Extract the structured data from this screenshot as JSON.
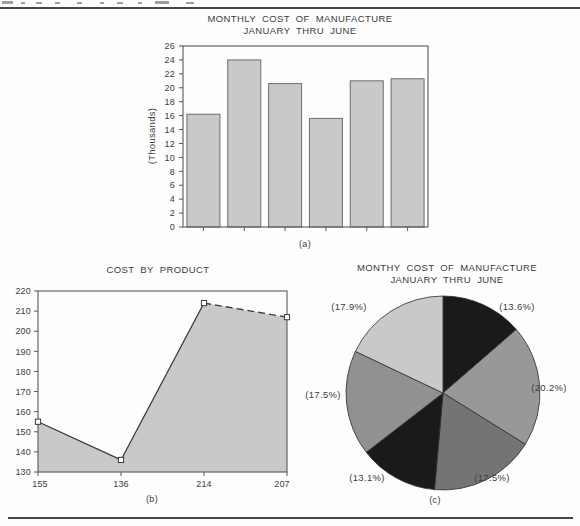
{
  "captions": {
    "a": "(a)",
    "b": "(b)",
    "c": "(c)"
  },
  "chart_data": [
    {
      "id": "monthly-cost-bar",
      "type": "bar",
      "title": "MONTHLY COST OF MANUFACTURE",
      "subtitle": "JANUARY THRU JUNE",
      "ylabel": "(Thousands)",
      "ylim": [
        0,
        26
      ],
      "yticks": [
        0,
        2,
        4,
        6,
        8,
        10,
        12,
        14,
        16,
        18,
        20,
        22,
        24,
        26
      ],
      "values": [
        16.2,
        24,
        20.6,
        15.6,
        21,
        21.3
      ],
      "grid": false,
      "legend": "none",
      "caption": "(a)",
      "bar_fill": "#c9c9c9",
      "bar_border": "#6e6e6e",
      "axis_color": "#585858"
    },
    {
      "id": "cost-by-product-area",
      "type": "area",
      "title": "COST BY PRODUCT",
      "ylim": [
        130,
        220
      ],
      "yticks": [
        130,
        140,
        150,
        160,
        170,
        180,
        190,
        200,
        210,
        220
      ],
      "x_tick_labels": [
        "155",
        "136",
        "214",
        "207"
      ],
      "values": [
        155,
        136,
        214,
        207
      ],
      "marker": "open-square",
      "dashed_last_segment": true,
      "grid": false,
      "legend": "none",
      "caption": "(b)",
      "fill": "#c9c9c9",
      "line_color": "#3a3a3a",
      "axis_color": "#585858"
    },
    {
      "id": "monthly-cost-pie",
      "type": "pie",
      "title": "MONTHY COST OF MANUFACTURE",
      "subtitle": "JANUARY THRU JUNE",
      "start_angle_deg": 0,
      "clockwise": true,
      "slices": [
        {
          "label": "(13.6%)",
          "value": 13.6,
          "color": "#1a1a1a"
        },
        {
          "label": "(20.2%)",
          "value": 20.2,
          "color": "#989898"
        },
        {
          "label": "(17.5%)",
          "value": 17.5,
          "color": "#747474"
        },
        {
          "label": "(13.1%)",
          "value": 13.1,
          "color": "#1a1a1a"
        },
        {
          "label": "(17.5%)",
          "value": 17.5,
          "color": "#919191"
        },
        {
          "label": "(17.9%)",
          "value": 17.9,
          "color": "#c9c9c9"
        }
      ],
      "caption": "(c)",
      "outline_color": "#2f2f2f"
    }
  ]
}
